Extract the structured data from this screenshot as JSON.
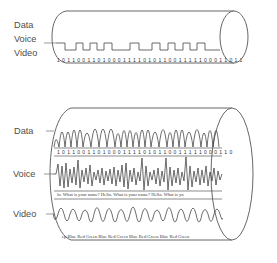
{
  "figure": {
    "title_top": "Baseband Transmission",
    "title_bottom": "Broadband Transmission",
    "baseband": {
      "labels": [
        "Data",
        "Voice",
        "Video"
      ],
      "bitstream": "1 0 1 1 0 0 1 1 0 1 0 0 0 1 1 1 1 0 1 0 1 1 0 0 1 1 1 1 1 0 0 0 1 1 0 1 1",
      "signal_type": "square-wave-digital",
      "caption": "Baseband Transmission"
    },
    "broadband": {
      "channels": [
        {
          "label": "Data",
          "signal_type": "fsk-modulated-carrier",
          "annotation": "1 0 1 1 0 0 1 1 0 1 0 0 0 1 1 1 1 0 1 0 1 1 0 0 1 1 1 1 1 0 0 0 1 1 0"
        },
        {
          "label": "Voice",
          "signal_type": "analog-voice-waveform",
          "annotation": "lo. What is your name? Hello. What is your name? Hello. What is yo"
        },
        {
          "label": "Video",
          "signal_type": "am-modulated-carrier",
          "annotation": "ep Blue Red Green Blue Red Green Blue Red Green Blue Red Green"
        }
      ],
      "caption": "Broadband Transmission"
    },
    "colors": {
      "background": "#ffffff",
      "outline": "#565656",
      "waveform": "#3c3c3c",
      "text": "#4d4d4d"
    }
  }
}
